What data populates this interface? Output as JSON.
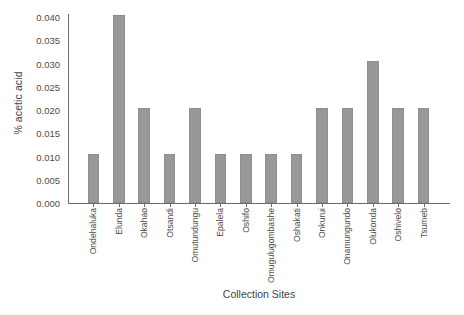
{
  "chart_data": {
    "type": "bar",
    "title": "",
    "xlabel": "Collection Sites",
    "ylabel": "% acetic acid",
    "ylim": [
      0.0,
      0.04
    ],
    "ytick_values": [
      0.0,
      0.005,
      0.01,
      0.015,
      0.02,
      0.025,
      0.03,
      0.035,
      0.04
    ],
    "ytick_labels": [
      "0.000",
      "0.005",
      "0.010",
      "0.015",
      "0.020",
      "0.025",
      "0.030",
      "0.035",
      "0.040"
    ],
    "grid": false,
    "legend": null,
    "bar_color": "#989898",
    "axis_color": "#6b6b6b",
    "categories": [
      "Ondehaluka",
      "Elunda",
      "Okahao",
      "Otsandi",
      "Omutundungu",
      "Epalela",
      "Oshifo",
      "Omugulugombashe",
      "Oshakati",
      "Onkurui",
      "Onamungundo",
      "Olukonda",
      "Oshivelo",
      "Tsumeb"
    ],
    "values": [
      0.0105,
      0.0405,
      0.0205,
      0.0105,
      0.0205,
      0.0105,
      0.0105,
      0.0105,
      0.0105,
      0.0205,
      0.0205,
      0.0305,
      0.0205,
      0.0205
    ]
  }
}
